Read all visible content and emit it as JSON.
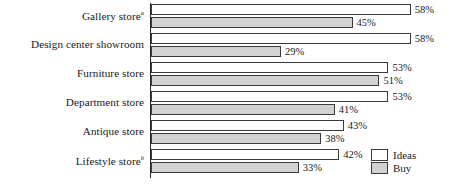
{
  "chart_data": {
    "type": "bar",
    "orientation": "horizontal",
    "title": "",
    "subtitle": "",
    "xlabel": "",
    "ylabel": "",
    "xlim": [
      0,
      60
    ],
    "grid": false,
    "legend_position": "bottom-right",
    "categories": [
      "Gallery store",
      "Design center showroom",
      "Furniture store",
      "Department store",
      "Antique store",
      "Lifestyle store"
    ],
    "category_footnotes": [
      "a",
      "",
      "",
      "",
      "",
      "b"
    ],
    "series": [
      {
        "name": "Ideas",
        "color": "#ffffff",
        "values": [
          58,
          58,
          53,
          53,
          43,
          42
        ],
        "labels": [
          "58%",
          "58%",
          "53%",
          "53%",
          "43%",
          "42%"
        ]
      },
      {
        "name": "Buy",
        "color": "#d2d2d2",
        "values": [
          45,
          29,
          51,
          41,
          38,
          33
        ],
        "labels": [
          "45%",
          "29%",
          "51%",
          "41%",
          "38%",
          "33%"
        ]
      }
    ]
  },
  "legend": {
    "items": [
      {
        "label": "Ideas",
        "swatch": "ideas"
      },
      {
        "label": "Buy",
        "swatch": "buy"
      }
    ]
  },
  "colors": {
    "ideas_fill": "#ffffff",
    "buy_fill": "#d2d2d2",
    "bar_stroke": "#3a3a3a",
    "axis": "#2b2b2b",
    "text": "#1a1a1a"
  }
}
